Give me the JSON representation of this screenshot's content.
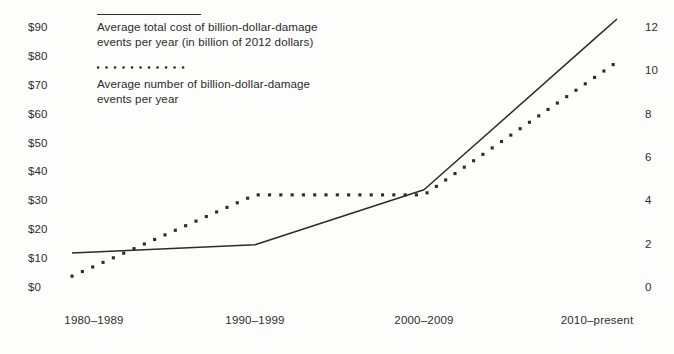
{
  "chart_data": {
    "type": "line",
    "title": "",
    "subtitle": "",
    "xlabel": "",
    "ylabel": "",
    "grid": false,
    "legend_position": "top-left",
    "categories": [
      "1980–1989",
      "1990–1999",
      "2000–2009",
      "2010–present"
    ],
    "axes": {
      "left": {
        "label": "",
        "ticks": [
          "$0",
          "$10",
          "$20",
          "$30",
          "$40",
          "$50",
          "$60",
          "$70",
          "$80",
          "$90"
        ],
        "tick_values": [
          0,
          10,
          20,
          30,
          40,
          50,
          60,
          70,
          80,
          90
        ],
        "ylim": [
          0,
          90
        ],
        "prefix": "$"
      },
      "right": {
        "label": "",
        "ticks": [
          "0",
          "2",
          "4",
          "6",
          "8",
          "10",
          "12"
        ],
        "tick_values": [
          0,
          2,
          4,
          6,
          8,
          10,
          12
        ],
        "ylim": [
          0,
          12
        ]
      }
    },
    "series": [
      {
        "name": "Average total cost of billion-dollar-damage events per year (in billion of 2012 dollars)",
        "axis": "left",
        "style": "solid",
        "color": "#2b2b2b",
        "values": [
          12.5,
          15,
          34,
          87
        ]
      },
      {
        "name": "Average number of billion-dollar-damage events per year",
        "axis": "right",
        "style": "dotted",
        "color": "#2b2b2b",
        "values": [
          1.0,
          4.3,
          4.3,
          9.8
        ]
      }
    ]
  },
  "legend": {
    "items": [
      {
        "marker": "solid-line-swatch",
        "label": "Average total cost of billion-dollar-damage events per year (in billion of 2012 dollars)"
      },
      {
        "marker": "dotted-line-swatch",
        "label": "Average number of billion-dollar-damage events per year"
      }
    ]
  },
  "colors": {
    "ink": "#2b2b2b",
    "background": "#fdfdfc",
    "axis": "#2e2e2e"
  }
}
